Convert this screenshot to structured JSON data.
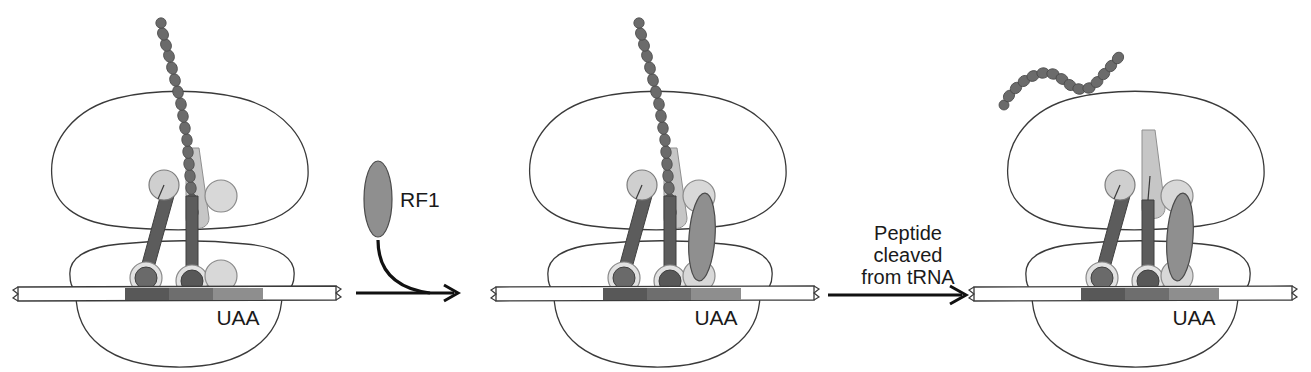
{
  "figure": {
    "background": "#ffffff"
  },
  "labels": {
    "stop_codon": "UAA",
    "release_factor": "RF1",
    "step_line1": "Peptide",
    "step_line2": "cleaved",
    "step_line3": "from tRNA"
  },
  "colors": {
    "outline": "#3a3a3a",
    "text": "#1a1a1a",
    "mrna_fill": "#ffffff",
    "codon_dark": "#585858",
    "codon_mid": "#6e6e6e",
    "codon_light": "#8e8e8e",
    "trna_stem_dark": "#5c5c5c",
    "trna_head_light": "#cfcfcf",
    "trna_anticodon_dark": "#6a6a6a",
    "peptide_bead": "#6b6b6b",
    "exit_tunnel": "#c2c2c2",
    "rf1_fill": "#8f8f8f",
    "arrow": "#111111"
  },
  "panels": [
    {
      "id": "panel-1",
      "name": "elongation-complex-with-stop-codon",
      "stop_codon_label": "UAA",
      "has_nascent_peptide": true,
      "has_release_factor": false,
      "peptide_released": false,
      "tRNA_sites": [
        "E",
        "P",
        "A"
      ],
      "occupied_sites": [
        "E",
        "P"
      ],
      "codons": [
        "dark",
        "mid",
        "light"
      ]
    },
    {
      "id": "panel-2",
      "name": "rf1-bound-at-a-site",
      "stop_codon_label": "UAA",
      "has_nascent_peptide": true,
      "has_release_factor": true,
      "peptide_released": false,
      "tRNA_sites": [
        "E",
        "P",
        "A"
      ],
      "occupied_sites": [
        "E",
        "P",
        "A"
      ],
      "codons": [
        "dark",
        "mid",
        "light"
      ]
    },
    {
      "id": "panel-3",
      "name": "peptide-released-from-trna",
      "stop_codon_label": "UAA",
      "has_nascent_peptide": false,
      "has_release_factor": true,
      "peptide_released": true,
      "tRNA_sites": [
        "E",
        "P",
        "A"
      ],
      "occupied_sites": [
        "E",
        "P",
        "A"
      ],
      "codons": [
        "dark",
        "mid",
        "light"
      ]
    }
  ],
  "transitions": [
    {
      "id": "transition-1",
      "name": "rf1-binding",
      "label": "RF1",
      "kind": "curved-entry-arrow"
    },
    {
      "id": "transition-2",
      "name": "peptide-cleavage",
      "label": "Peptide cleaved from tRNA",
      "kind": "straight-arrow"
    }
  ]
}
